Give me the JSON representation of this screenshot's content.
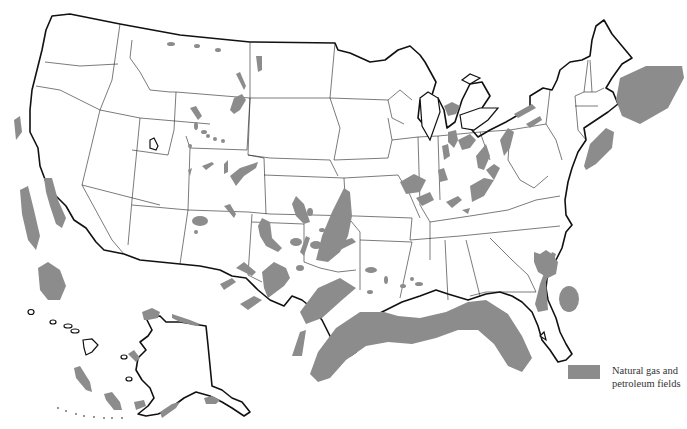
{
  "map": {
    "subject": "United States natural gas and petroleum fields",
    "regions_shown": [
      "Contiguous United States",
      "Alaska",
      "Hawaii",
      "Atlantic offshore",
      "Gulf of Mexico offshore",
      "Pacific offshore"
    ],
    "colors": {
      "field": "#8c8c8c",
      "border": "#111111",
      "land": "#ffffff"
    }
  },
  "legend": {
    "items": [
      {
        "label": "Natural gas and petroleum fields",
        "color": "#8c8c8c"
      }
    ]
  }
}
